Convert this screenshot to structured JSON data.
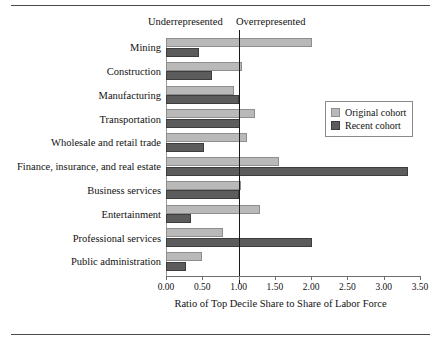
{
  "chart_data": {
    "type": "bar",
    "orientation": "horizontal",
    "title": "",
    "xlabel": "Ratio of Top Decile Share to Share of Labor Force",
    "ylabel": "",
    "xlim": [
      0.0,
      3.5
    ],
    "xticks": [
      "0.00",
      "0.50",
      "1.00",
      "1.50",
      "2.00",
      "2.50",
      "3.00",
      "3.50"
    ],
    "xtick_values": [
      0.0,
      0.5,
      1.0,
      1.5,
      2.0,
      2.5,
      3.0,
      3.5
    ],
    "grid": false,
    "reference_line": 1.0,
    "region_labels": {
      "left": "Underrepresented",
      "right": "Overrepresented"
    },
    "legend_position": "right",
    "categories": [
      "Mining",
      "Construction",
      "Manufacturing",
      "Transportation",
      "Wholesale and retail trade",
      "Finance, insurance, and real estate",
      "Business services",
      "Entertainment",
      "Professional services",
      "Public administration"
    ],
    "series": [
      {
        "name": "Original cohort",
        "color": "#b9b9b9",
        "values": [
          2.01,
          1.05,
          0.94,
          1.22,
          1.12,
          1.56,
          1.04,
          1.29,
          0.79,
          0.5
        ]
      },
      {
        "name": "Recent cohort",
        "color": "#5c5c5c",
        "values": [
          0.45,
          0.63,
          1.01,
          1.02,
          0.53,
          3.33,
          1.0,
          0.35,
          2.01,
          0.27
        ]
      }
    ]
  }
}
